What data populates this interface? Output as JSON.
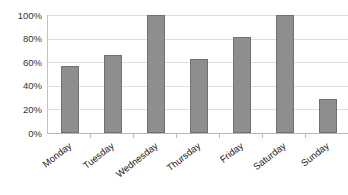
{
  "chart_data": {
    "type": "bar",
    "title": "",
    "xlabel": "",
    "ylabel": "",
    "categories": [
      "Monday",
      "Tuesday",
      "Wednesday",
      "Thursday",
      "Friday",
      "Saturday",
      "Sunday"
    ],
    "values": [
      57,
      66,
      100,
      63,
      81,
      100,
      29
    ],
    "y_tick_labels": [
      "100%",
      "80%",
      "60%",
      "40%",
      "20%",
      "0%"
    ],
    "ylim": [
      0,
      100
    ],
    "grid": true,
    "legend": false,
    "colors": {
      "bar_fill": "#8e8e8e",
      "bar_border": "#717171",
      "gridline": "#dedede",
      "axis_line": "#b8b8b8",
      "y_tick_text": "#333333",
      "x_tick_text": "#1a1a1a",
      "background": "#ffffff"
    }
  }
}
